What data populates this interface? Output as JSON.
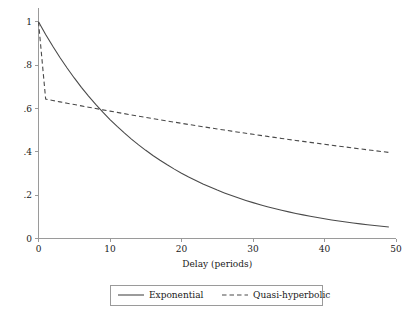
{
  "chart_data": {
    "type": "line",
    "title": "",
    "subtitle": "",
    "xlabel": "Delay (periods)",
    "ylabel": "",
    "xlim": [
      0,
      50
    ],
    "ylim": [
      0,
      1.05
    ],
    "grid": false,
    "legend_position": "bottom-center",
    "xticks": [
      "0",
      "10",
      "20",
      "30",
      "40",
      "50"
    ],
    "xtick_values": [
      0,
      10,
      20,
      30,
      40,
      50
    ],
    "yticks": [
      "0",
      ".2",
      ".4",
      ".6",
      ".8",
      "1"
    ],
    "ytick_values": [
      0,
      0.2,
      0.4,
      0.6,
      0.8,
      1
    ],
    "x": [
      0,
      1,
      2,
      3,
      4,
      5,
      6,
      7,
      8,
      9,
      10,
      11,
      12,
      13,
      14,
      15,
      16,
      17,
      18,
      19,
      20,
      21,
      22,
      23,
      24,
      25,
      26,
      27,
      28,
      29,
      30,
      31,
      32,
      33,
      34,
      35,
      36,
      37,
      38,
      39,
      40,
      41,
      42,
      43,
      44,
      45,
      46,
      47,
      48,
      49
    ],
    "series": [
      {
        "name": "Exponential",
        "style": "solid",
        "color": "#4a4a4a",
        "values": [
          1.0,
          0.9418,
          0.887,
          0.8354,
          0.7868,
          0.741,
          0.6979,
          0.6573,
          0.6191,
          0.5831,
          0.5491,
          0.5172,
          0.4871,
          0.4588,
          0.4321,
          0.407,
          0.3833,
          0.361,
          0.34,
          0.3202,
          0.3016,
          0.284,
          0.2675,
          0.2519,
          0.2373,
          0.2234,
          0.2104,
          0.1982,
          0.1867,
          0.1758,
          0.1656,
          0.156,
          0.1469,
          0.1384,
          0.1303,
          0.1227,
          0.1156,
          0.1089,
          0.1025,
          0.0966,
          0.091,
          0.0857,
          0.0807,
          0.076,
          0.0716,
          0.0674,
          0.0635,
          0.0598,
          0.0563,
          0.053
        ]
      },
      {
        "name": "Quasi-hyperbolic",
        "style": "dashed",
        "color": "#4a4a4a",
        "values": [
          1.0,
          0.6435,
          0.6371,
          0.6307,
          0.6244,
          0.6182,
          0.612,
          0.6059,
          0.5998,
          0.5938,
          0.5879,
          0.582,
          0.5762,
          0.5704,
          0.5647,
          0.5591,
          0.5535,
          0.5479,
          0.5425,
          0.537,
          0.5317,
          0.5263,
          0.5211,
          0.5159,
          0.5107,
          0.5056,
          0.5006,
          0.4956,
          0.4906,
          0.4857,
          0.4808,
          0.476,
          0.4713,
          0.4666,
          0.4619,
          0.4573,
          0.4527,
          0.4482,
          0.4437,
          0.4393,
          0.4349,
          0.4305,
          0.4262,
          0.422,
          0.4177,
          0.4136,
          0.4094,
          0.4053,
          0.4013,
          0.3973
        ]
      }
    ],
    "legend": [
      {
        "label": "Exponential",
        "style": "solid"
      },
      {
        "label": "Quasi-hyperbolic",
        "style": "dashed"
      }
    ]
  },
  "axes": {
    "x_title": "Delay (periods)"
  },
  "colors": {
    "line": "#4a4a4a",
    "axis": "#9a9a9a",
    "text": "#1a1a1a",
    "background": "#ffffff"
  }
}
